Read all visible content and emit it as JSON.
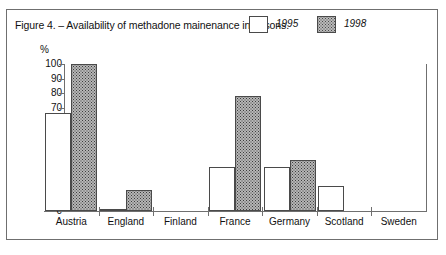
{
  "figure": {
    "title": "Figure 4. – Availability of methadone mainenance in prisons.",
    "percent_symbol": "%"
  },
  "legend": {
    "items": [
      {
        "label": "1995",
        "swatch": "white-square",
        "color": "#ffffff"
      },
      {
        "label": "1998",
        "swatch": "dotted-gray-square",
        "color": "#b6b6b6"
      }
    ]
  },
  "chart_data": {
    "type": "bar",
    "title": "Figure 4. – Availability of methadone mainenance in prisons.",
    "xlabel": "",
    "ylabel": "%",
    "ylim": [
      0,
      100
    ],
    "ytick_labels": [
      "100",
      "90",
      "80",
      "70",
      "60",
      "50",
      "40",
      "30",
      "20",
      "10",
      "0"
    ],
    "ytick_values": [
      100,
      90,
      80,
      70,
      60,
      50,
      40,
      30,
      20,
      10,
      0
    ],
    "grid": false,
    "legend_position": "top-right",
    "categories": [
      "Austria",
      "England",
      "Finland",
      "France",
      "Germany",
      "Scotland",
      "Sweden"
    ],
    "series": [
      {
        "name": "1995",
        "values": [
          67,
          1.5,
          0,
          30,
          30,
          17,
          0
        ]
      },
      {
        "name": "1998",
        "values": [
          100,
          14,
          0,
          78,
          35,
          0,
          0
        ]
      }
    ]
  }
}
